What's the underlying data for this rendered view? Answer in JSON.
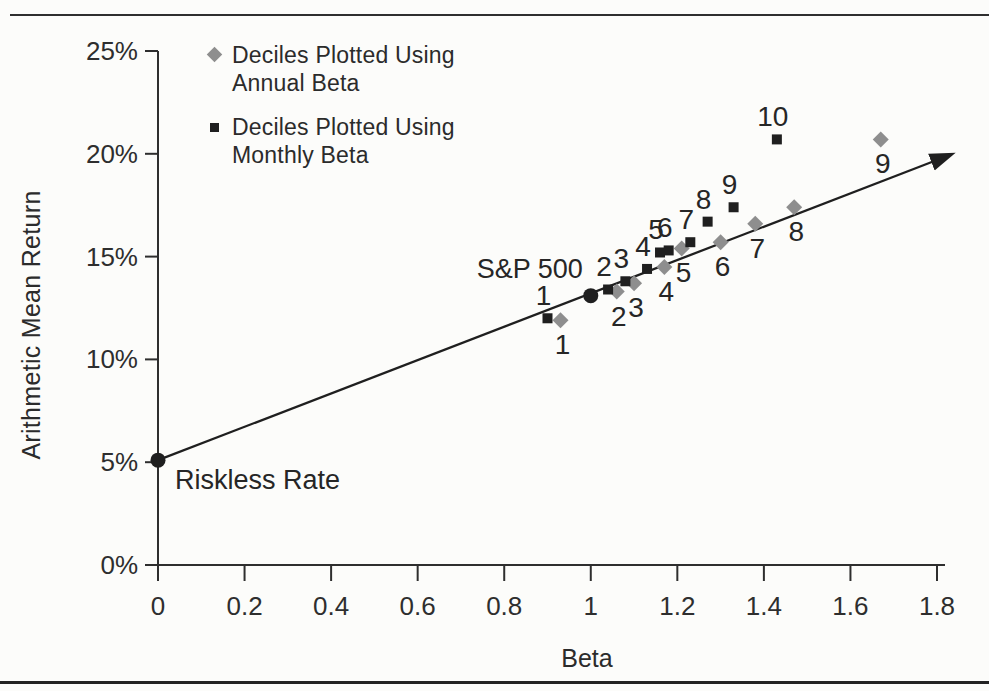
{
  "figure": {
    "background": "#fcfcfa",
    "ink_color": "#1f1f1f",
    "gray_color": "#8e8e8e"
  },
  "legend": {
    "position": "top-left-inside",
    "items": [
      {
        "marker": "diamond",
        "lines": [
          "Deciles Plotted Using",
          "Annual Beta"
        ]
      },
      {
        "marker": "square",
        "lines": [
          "Deciles Plotted Using",
          "Monthly Beta"
        ]
      }
    ]
  },
  "chart_data": {
    "type": "scatter",
    "title": "",
    "xlabel": "Beta",
    "ylabel": "Arithmetic Mean Return",
    "xlim": [
      0,
      1.8
    ],
    "ylim_pct": [
      0,
      25
    ],
    "grid": false,
    "x_ticks": [
      {
        "v": 0,
        "label": "0"
      },
      {
        "v": 0.2,
        "label": "0.2"
      },
      {
        "v": 0.4,
        "label": "0.4"
      },
      {
        "v": 0.6,
        "label": "0.6"
      },
      {
        "v": 0.8,
        "label": "0.8"
      },
      {
        "v": 1,
        "label": "1"
      },
      {
        "v": 1.2,
        "label": "1.2"
      },
      {
        "v": 1.4,
        "label": "1.4"
      },
      {
        "v": 1.6,
        "label": "1.6"
      },
      {
        "v": 1.8,
        "label": "1.8"
      }
    ],
    "y_ticks": [
      {
        "v": 25,
        "label": "25%"
      },
      {
        "v": 20,
        "label": "20%"
      },
      {
        "v": 15,
        "label": "15%"
      },
      {
        "v": 10,
        "label": "10%"
      },
      {
        "v": 5,
        "label": "5%"
      },
      {
        "v": 0,
        "label": "0%"
      }
    ],
    "series": [
      {
        "name": "Deciles Plotted Using Annual Beta",
        "marker": "diamond",
        "color": "#8e8e8e",
        "label_side": "below",
        "points": [
          {
            "decile": "1",
            "beta": 0.93,
            "return_pct": 11.9
          },
          {
            "decile": "2",
            "beta": 1.06,
            "return_pct": 13.3
          },
          {
            "decile": "3",
            "beta": 1.1,
            "return_pct": 13.7
          },
          {
            "decile": "4",
            "beta": 1.17,
            "return_pct": 14.5
          },
          {
            "decile": "5",
            "beta": 1.21,
            "return_pct": 15.4
          },
          {
            "decile": "6",
            "beta": 1.3,
            "return_pct": 15.7
          },
          {
            "decile": "7",
            "beta": 1.38,
            "return_pct": 16.6
          },
          {
            "decile": "8",
            "beta": 1.47,
            "return_pct": 17.4
          },
          {
            "decile": "9",
            "beta": 1.67,
            "return_pct": 20.7
          }
        ]
      },
      {
        "name": "Deciles Plotted Using Monthly Beta",
        "marker": "square",
        "color": "#1f1f1f",
        "label_side": "above",
        "points": [
          {
            "decile": "1",
            "beta": 0.9,
            "return_pct": 12.0
          },
          {
            "decile": "2",
            "beta": 1.04,
            "return_pct": 13.4
          },
          {
            "decile": "3",
            "beta": 1.08,
            "return_pct": 13.8
          },
          {
            "decile": "4",
            "beta": 1.13,
            "return_pct": 14.4
          },
          {
            "decile": "5",
            "beta": 1.16,
            "return_pct": 15.2
          },
          {
            "decile": "6",
            "beta": 1.18,
            "return_pct": 15.3
          },
          {
            "decile": "7",
            "beta": 1.23,
            "return_pct": 15.7
          },
          {
            "decile": "8",
            "beta": 1.27,
            "return_pct": 16.7
          },
          {
            "decile": "9",
            "beta": 1.33,
            "return_pct": 17.4
          },
          {
            "decile": "10",
            "beta": 1.43,
            "return_pct": 20.7
          }
        ]
      }
    ],
    "reference_points": [
      {
        "label": "S&P 500",
        "beta": 1.0,
        "return_pct": 13.1,
        "anchor": "end",
        "label_dx": -8,
        "label_dy": -18
      },
      {
        "label": "Riskless Rate",
        "beta": 0.0,
        "return_pct": 5.1,
        "anchor": "start",
        "label_dx": 17,
        "label_dy": 29
      }
    ],
    "security_market_line": {
      "start": {
        "beta": 0,
        "return_pct": 5.1
      },
      "end": {
        "beta": 1.8,
        "return_pct": 19.7
      },
      "arrowhead": true
    }
  }
}
